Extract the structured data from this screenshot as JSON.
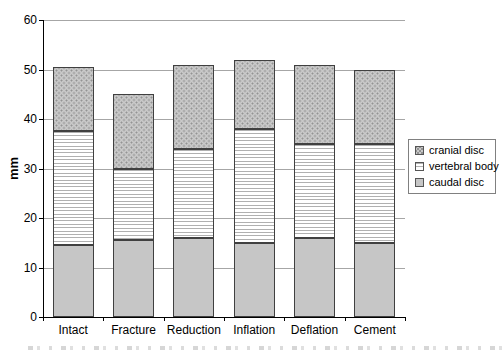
{
  "chart_data": {
    "type": "bar",
    "stacked": true,
    "title": "",
    "xlabel": "",
    "ylabel": "mm",
    "ylim": [
      0,
      60
    ],
    "yticks": [
      0,
      10,
      20,
      30,
      40,
      50,
      60
    ],
    "grid": true,
    "legend_position": "right",
    "categories": [
      "Intact",
      "Fracture",
      "Reduction",
      "Inflation",
      "Deflation",
      "Cement"
    ],
    "series": [
      {
        "name": "caudal disc",
        "pattern": "solid",
        "values": [
          14.5,
          15.5,
          16,
          15,
          16,
          15
        ]
      },
      {
        "name": "vertebral body",
        "pattern": "hlines",
        "values": [
          23,
          14.5,
          18,
          23,
          19,
          20
        ]
      },
      {
        "name": "cranial disc",
        "pattern": "dots",
        "values": [
          13,
          15,
          17,
          14,
          16,
          15
        ]
      }
    ],
    "legend_entries": [
      {
        "label": "cranial disc",
        "pattern": "dots"
      },
      {
        "label": "vertebral body",
        "pattern": "hlines"
      },
      {
        "label": "caudal disc",
        "pattern": "solid"
      }
    ]
  },
  "colors": {
    "plot_background": "#ffffff",
    "gridline": "#a6a6a6",
    "axis": "#000000",
    "bar_border": "#404040",
    "caudal_disc_fill": "#c6c6c6",
    "cranial_disc_background": "#c9c9c9",
    "cranial_disc_dot": "#939393",
    "vertebral_body_background": "#ffffff",
    "vertebral_body_line": "#b0b0b0",
    "legend_border": "#808080"
  }
}
